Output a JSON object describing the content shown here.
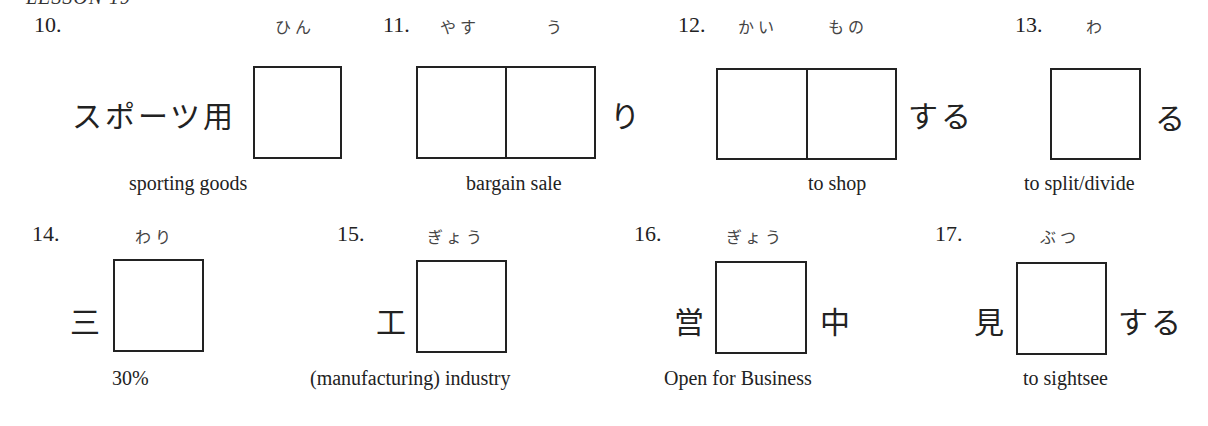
{
  "header": {
    "title": "LESSON 19"
  },
  "exercises": [
    {
      "number": "10.",
      "furigana": [
        "ひん"
      ],
      "prefix": "スポーツ用",
      "suffix": "",
      "boxes": 1,
      "gloss": "sporting goods"
    },
    {
      "number": "11.",
      "furigana": [
        "やす",
        "う"
      ],
      "prefix": "",
      "suffix": "り",
      "boxes": 2,
      "gloss": "bargain sale"
    },
    {
      "number": "12.",
      "furigana": [
        "かい",
        "もの"
      ],
      "prefix": "",
      "suffix": "する",
      "boxes": 2,
      "gloss": "to shop"
    },
    {
      "number": "13.",
      "furigana": [
        "わ"
      ],
      "prefix": "",
      "suffix": "る",
      "boxes": 1,
      "gloss": "to split/divide"
    },
    {
      "number": "14.",
      "furigana": [
        "わり"
      ],
      "prefix": "三",
      "suffix": "",
      "boxes": 1,
      "gloss": "30%"
    },
    {
      "number": "15.",
      "furigana": [
        "ぎょう"
      ],
      "prefix": "工",
      "suffix": "",
      "boxes": 1,
      "gloss": "(manufacturing) industry"
    },
    {
      "number": "16.",
      "furigana": [
        "ぎょう"
      ],
      "prefix": "営",
      "suffix": "中",
      "boxes": 1,
      "gloss": "Open for Business"
    },
    {
      "number": "17.",
      "furigana": [
        "ぶつ"
      ],
      "prefix": "見",
      "suffix": "する",
      "boxes": 1,
      "gloss": "to sightsee"
    }
  ]
}
